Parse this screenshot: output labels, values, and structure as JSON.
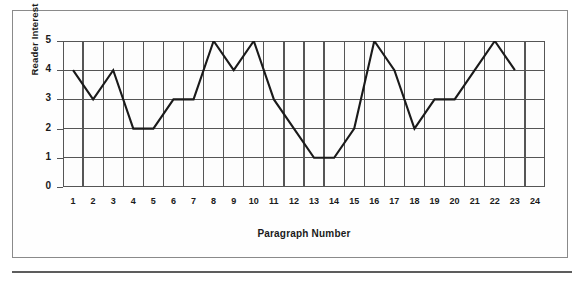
{
  "chart_data": {
    "type": "line",
    "title": "",
    "xlabel": "Paragraph Number",
    "ylabel": "Reader Interest",
    "x": [
      1,
      2,
      3,
      4,
      5,
      6,
      7,
      8,
      9,
      10,
      11,
      12,
      13,
      14,
      15,
      16,
      17,
      18,
      19,
      20,
      21,
      22,
      23,
      24
    ],
    "categories": [
      "1",
      "2",
      "3",
      "4",
      "5",
      "6",
      "7",
      "8",
      "9",
      "10",
      "11",
      "12",
      "13",
      "14",
      "15",
      "16",
      "17",
      "18",
      "19",
      "20",
      "21",
      "22",
      "23",
      "24"
    ],
    "values": [
      4,
      3,
      4,
      2,
      2,
      3,
      3,
      5,
      4,
      5,
      3,
      2,
      1,
      1,
      2,
      5,
      4,
      2,
      3,
      3,
      4,
      5,
      4,
      null
    ],
    "series": [
      {
        "name": "Reader Interest",
        "values": [
          4,
          3,
          4,
          2,
          2,
          3,
          3,
          5,
          4,
          5,
          3,
          2,
          1,
          1,
          2,
          5,
          4,
          2,
          3,
          3,
          4,
          5,
          4,
          null
        ]
      }
    ],
    "xlim": [
      1,
      24
    ],
    "ylim": [
      0,
      5
    ],
    "ytick_labels": [
      "0",
      "1",
      "2",
      "3",
      "4",
      "5"
    ],
    "yticks": [
      0,
      1,
      2,
      3,
      4,
      5
    ],
    "grid": true,
    "grid_x": true,
    "grid_y": true,
    "legend": null,
    "line_color": "#1a1a1a",
    "grid_color": "#555555",
    "plot_background": "#fdfdfd",
    "frame_color": "#8a8a8a"
  }
}
